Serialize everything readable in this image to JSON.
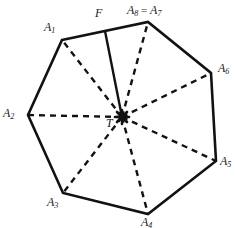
{
  "figure": {
    "type": "geometry-diagram",
    "width": 236,
    "height": 228,
    "colors": {
      "background": "#ffffff",
      "stroke": "#121212",
      "label": "#1a1a1a"
    },
    "style": {
      "polygon_stroke_width": 2.6,
      "radius_stroke_width": 2.4,
      "radius_dash": "6 5",
      "segment_stroke_width": 2.4
    }
  },
  "geometry": {
    "center": {
      "name": "T",
      "x": 122,
      "y": 117
    },
    "foot": {
      "name": "F",
      "x": 105,
      "y": 31
    },
    "vertices": [
      {
        "key": "A1",
        "x": 62,
        "y": 40
      },
      {
        "key": "A2",
        "x": 28,
        "y": 115
      },
      {
        "key": "A3",
        "x": 63,
        "y": 193
      },
      {
        "key": "A4",
        "x": 148,
        "y": 214
      },
      {
        "key": "A5",
        "x": 216,
        "y": 161
      },
      {
        "key": "A6",
        "x": 211,
        "y": 73
      },
      {
        "key": "A78",
        "x": 148,
        "y": 22
      }
    ],
    "polygon_path": "62,40 148,22 211,73 216,161 148,214 63,193 28,115",
    "radii": [
      {
        "from": "T",
        "to": "A1",
        "style": "dashed"
      },
      {
        "from": "T",
        "to": "A2",
        "style": "dashed"
      },
      {
        "from": "T",
        "to": "A3",
        "style": "dashed"
      },
      {
        "from": "T",
        "to": "A4",
        "style": "dashed"
      },
      {
        "from": "T",
        "to": "A5",
        "style": "dashed"
      },
      {
        "from": "T",
        "to": "A6",
        "style": "dashed"
      },
      {
        "from": "T",
        "to": "A78",
        "style": "dashed"
      }
    ],
    "segments": [
      {
        "from": "F",
        "to": "T",
        "style": "solid"
      }
    ]
  },
  "labels": {
    "a1": {
      "base": "A",
      "sub": "1",
      "x": 44,
      "y": 21
    },
    "a2": {
      "base": "A",
      "sub": "2",
      "x": 3,
      "y": 107
    },
    "a3": {
      "base": "A",
      "sub": "3",
      "x": 47,
      "y": 196
    },
    "a4": {
      "base": "A",
      "sub": "4",
      "x": 141,
      "y": 216
    },
    "a5": {
      "base": "A",
      "sub": "5",
      "x": 220,
      "y": 155
    },
    "a6": {
      "base": "A",
      "sub": "6",
      "x": 218,
      "y": 62
    },
    "a78": {
      "base": "A",
      "sub": "8",
      "eq": " = ",
      "base2": "A",
      "sub2": "7",
      "x": 127,
      "y": 4
    },
    "f": {
      "base": "F",
      "x": 95,
      "y": 7
    },
    "t": {
      "base": "T",
      "x": 106,
      "y": 117
    }
  }
}
